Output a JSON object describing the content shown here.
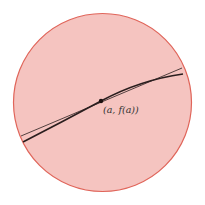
{
  "diagram": {
    "point_label": "(a, f(a))",
    "colors": {
      "circle_fill": "#f5c4c0",
      "circle_stroke": "#e0655a",
      "line": "#2a1e1e",
      "background": "#ffffff"
    },
    "elements": [
      {
        "type": "circle",
        "description": "magnified view region"
      },
      {
        "type": "curve",
        "description": "graph of f (thick)"
      },
      {
        "type": "line",
        "description": "tangent line (thin)"
      },
      {
        "type": "point",
        "label": "(a, f(a))"
      }
    ]
  }
}
